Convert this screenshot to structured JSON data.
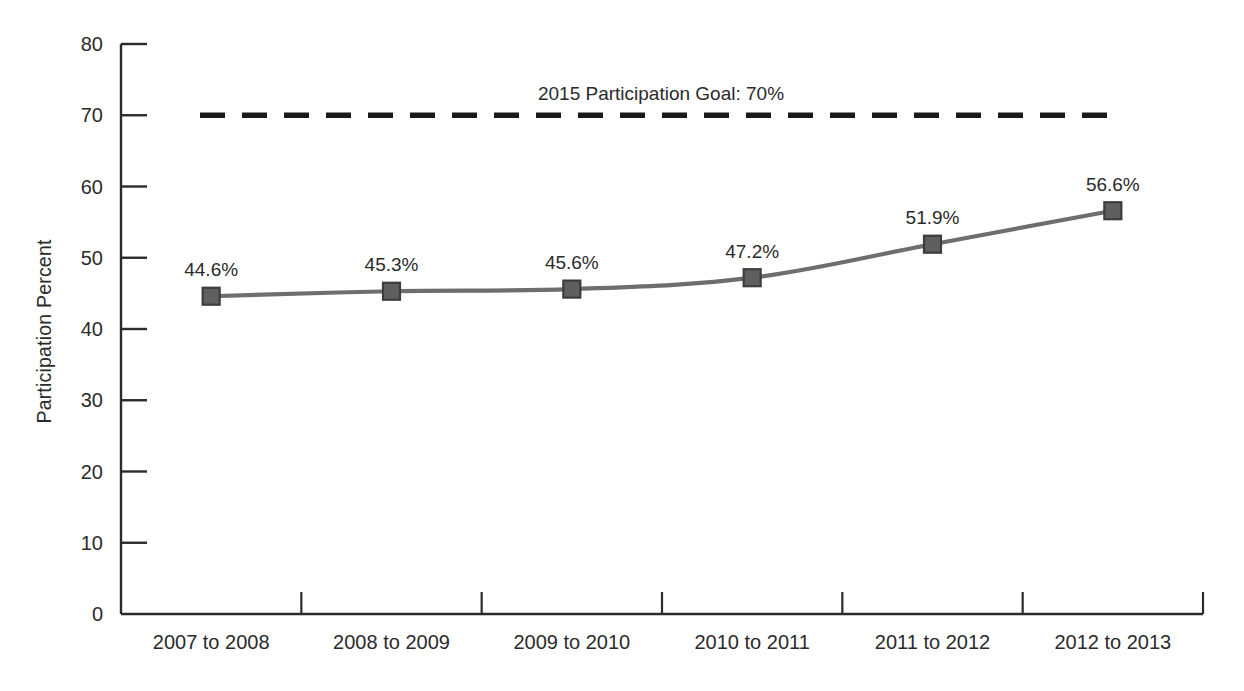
{
  "chart_data": {
    "type": "line",
    "title": "",
    "xlabel": "",
    "ylabel": "Participation Percent",
    "ylim": [
      0,
      80
    ],
    "ytick_step": 10,
    "yticks": [
      "0",
      "10",
      "20",
      "30",
      "40",
      "50",
      "60",
      "70",
      "80"
    ],
    "grid": false,
    "legend": false,
    "categories": [
      "2007 to 2008",
      "2008 to 2009",
      "2009 to 2010",
      "2010 to 2011",
      "2011 to 2012",
      "2012 to 2013"
    ],
    "values": [
      44.6,
      45.3,
      45.6,
      47.2,
      51.9,
      56.6
    ],
    "point_labels": [
      "44.6%",
      "45.3%",
      "45.6%",
      "47.2%",
      "51.9%",
      "56.6%"
    ],
    "marker": "square",
    "line_color": "#6e6e6e",
    "marker_fill": "#5f5f5f",
    "marker_edge": "#3d3d3d",
    "axis_color": "#2b2b2b",
    "annotations": [
      {
        "name": "goal-line",
        "text": "2015 Participation Goal: 70%",
        "value": 70,
        "style": "dashed",
        "color": "#1a1a1a"
      }
    ]
  }
}
